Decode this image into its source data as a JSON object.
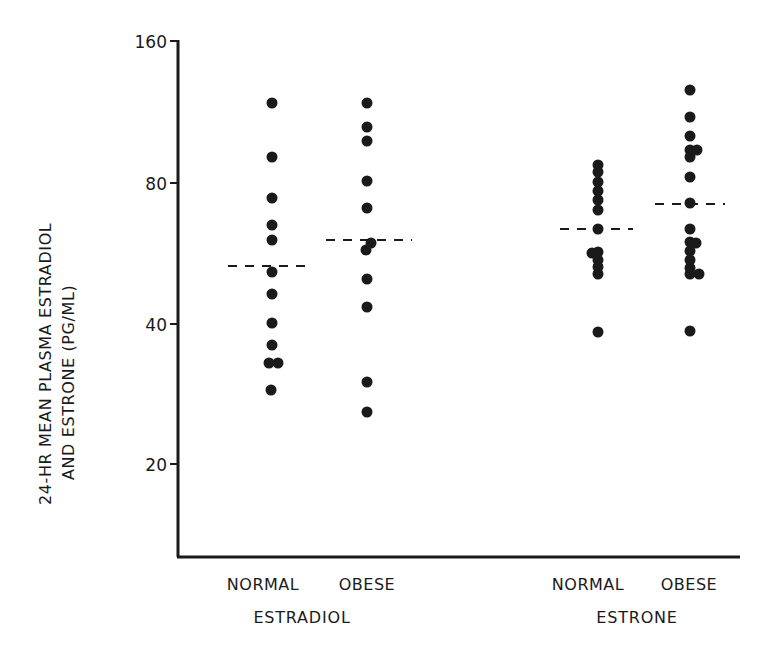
{
  "chart_data": {
    "type": "scatter",
    "subtype": "dot-plot",
    "title": "",
    "xlabel": "",
    "ylabel": "24-HR MEAN PLASMA ESTRADIOL AND ESTRONE (PG/ML)",
    "ylabel_lines": [
      "24-HR MEAN PLASMA ESTRADIOL",
      "AND ESTRONE (PG/ML)"
    ],
    "yscale": "log2",
    "ylim": [
      10,
      160
    ],
    "yticks": [
      20,
      40,
      80,
      160
    ],
    "ytick_labels": [
      "20",
      "40",
      "80",
      "160"
    ],
    "grid": false,
    "legend": null,
    "groups": [
      {
        "name": "ESTRADIOL",
        "categories": [
          "NORMAL",
          "OBESE"
        ]
      },
      {
        "name": "ESTRONE",
        "categories": [
          "NORMAL",
          "OBESE"
        ]
      }
    ],
    "series": [
      {
        "name": "Estradiol - Normal",
        "group": "ESTRADIOL",
        "category": "NORMAL",
        "values": [
          118,
          91,
          74,
          65,
          61,
          52,
          47,
          40,
          36,
          33,
          33,
          29
        ],
        "mean": 53
      },
      {
        "name": "Estradiol - Obese",
        "group": "ESTRADIOL",
        "category": "OBESE",
        "values": [
          118,
          105,
          98,
          81,
          71,
          60,
          58,
          50,
          44,
          30,
          26
        ],
        "mean": 61
      },
      {
        "name": "Estrone - Normal",
        "group": "ESTRONE",
        "category": "NORMAL",
        "values": [
          87,
          83,
          79,
          77,
          74,
          70,
          64,
          57,
          57,
          55,
          53,
          51,
          39
        ],
        "mean": 64
      },
      {
        "name": "Estrone - Obese",
        "group": "ESTRONE",
        "category": "OBESE",
        "values": [
          126,
          110,
          101,
          94,
          94,
          91,
          82,
          73,
          64,
          60,
          60,
          58,
          55,
          53,
          51,
          51,
          39
        ],
        "mean": 72
      }
    ],
    "mean_marker": "dashed horizontal line"
  },
  "points_px": {
    "e2_normal": [
      [
        272,
        103
      ],
      [
        272,
        157
      ],
      [
        272,
        198
      ],
      [
        272,
        225
      ],
      [
        272,
        240
      ],
      [
        272,
        272
      ],
      [
        272,
        294
      ],
      [
        272,
        323
      ],
      [
        272,
        345
      ],
      [
        269,
        363
      ],
      [
        278,
        363
      ],
      [
        271,
        390
      ]
    ],
    "e2_obese": [
      [
        367,
        103
      ],
      [
        367,
        127
      ],
      [
        367,
        141
      ],
      [
        367,
        181
      ],
      [
        367,
        208
      ],
      [
        371,
        243
      ],
      [
        366,
        250
      ],
      [
        367,
        279
      ],
      [
        367,
        307
      ],
      [
        367,
        382
      ],
      [
        367,
        412
      ]
    ],
    "e1_normal": [
      [
        598,
        165
      ],
      [
        598,
        172
      ],
      [
        598,
        182
      ],
      [
        598,
        191
      ],
      [
        598,
        200
      ],
      [
        598,
        210
      ],
      [
        598,
        229
      ],
      [
        592,
        253
      ],
      [
        598,
        252
      ],
      [
        598,
        260
      ],
      [
        598,
        267
      ],
      [
        598,
        274
      ],
      [
        598,
        332
      ]
    ],
    "e1_obese": [
      [
        690,
        90
      ],
      [
        690,
        117
      ],
      [
        690,
        136
      ],
      [
        690,
        150
      ],
      [
        697,
        150
      ],
      [
        690,
        157
      ],
      [
        690,
        177
      ],
      [
        690,
        203
      ],
      [
        690,
        229
      ],
      [
        690,
        242
      ],
      [
        696,
        243
      ],
      [
        690,
        251
      ],
      [
        690,
        260
      ],
      [
        690,
        268
      ],
      [
        690,
        274
      ],
      [
        699,
        274
      ],
      [
        690,
        331
      ]
    ]
  },
  "means_px": {
    "e2_normal": {
      "x1": 228,
      "x2": 313,
      "y": 266
    },
    "e2_obese": {
      "x1": 326,
      "x2": 412,
      "y": 240
    },
    "e1_normal": {
      "x1": 560,
      "x2": 633,
      "y": 229
    },
    "e1_obese": {
      "x1": 655,
      "x2": 725,
      "y": 204
    }
  },
  "labels": {
    "e2_normal": "NORMAL",
    "e2_obese": "OBESE",
    "e2_group": "ESTRADIOL",
    "e1_normal": "NORMAL",
    "e1_obese": "OBESE",
    "e1_group": "ESTRONE",
    "ylabel_line1": "24-HR MEAN PLASMA ESTRADIOL",
    "ylabel_line2": "AND ESTRONE (PG/ML)",
    "tick_160": "160",
    "tick_80": "80",
    "tick_40": "40",
    "tick_20": "20"
  },
  "colors": {
    "ink": "#1a1a1a",
    "background": "#ffffff"
  }
}
